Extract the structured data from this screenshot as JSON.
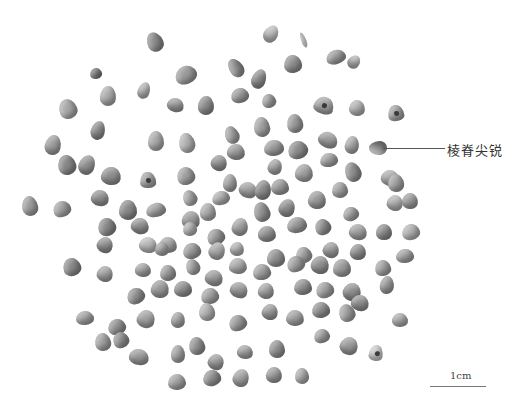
{
  "figure": {
    "annotation": {
      "label": "棱脊尖锐",
      "target": "seed-pointed-ridge"
    },
    "scale_bar": {
      "label": "1cm"
    }
  },
  "seeds": [
    [
      155,
      42,
      16,
      20,
      0,
      "#8a8a8a",
      0
    ],
    [
      271,
      34,
      14,
      18,
      20,
      "#b8b8b8",
      0
    ],
    [
      303,
      40,
      5,
      16,
      -20,
      "#e0e0e0",
      0
    ],
    [
      96,
      73,
      12,
      11,
      0,
      "#7a7a7a",
      0
    ],
    [
      108,
      96,
      16,
      20,
      -20,
      "#aaaaaa",
      0
    ],
    [
      144,
      90,
      12,
      17,
      10,
      "#b0b0b0",
      0
    ],
    [
      186,
      75,
      22,
      18,
      -20,
      "#999999",
      0
    ],
    [
      236,
      68,
      14,
      20,
      -20,
      "#909090",
      0
    ],
    [
      259,
      79,
      14,
      20,
      0,
      "#8a8a8a",
      0
    ],
    [
      240,
      95,
      18,
      15,
      -20,
      "#999999",
      0
    ],
    [
      293,
      64,
      18,
      18,
      0,
      "#8e8e8e",
      0
    ],
    [
      336,
      57,
      20,
      14,
      0,
      "#9a9a9a",
      0
    ],
    [
      354,
      62,
      12,
      14,
      20,
      "#b0b0b0",
      0
    ],
    [
      175,
      105,
      17,
      14,
      10,
      "#999999",
      0
    ],
    [
      206,
      105,
      16,
      19,
      10,
      "#8a8a8a",
      0
    ],
    [
      269,
      101,
      14,
      14,
      0,
      "#a0a0a0",
      0
    ],
    [
      324,
      105,
      20,
      17,
      0,
      "#a0a0a0",
      1
    ],
    [
      357,
      108,
      16,
      16,
      0,
      "#b0b0b0",
      0
    ],
    [
      396,
      113,
      16,
      16,
      0,
      "#a0a0a0",
      1
    ],
    [
      68,
      109,
      18,
      20,
      0,
      "#a6a6a6",
      0
    ],
    [
      98,
      130,
      14,
      19,
      0,
      "#8a8a8a",
      0
    ],
    [
      262,
      127,
      16,
      20,
      -10,
      "#a0a0a0",
      0
    ],
    [
      295,
      123,
      16,
      19,
      0,
      "#9a9a9a",
      0
    ],
    [
      232,
      135,
      14,
      18,
      0,
      "#a0a0a0",
      0
    ],
    [
      53,
      145,
      16,
      20,
      0,
      "#9c9c9c",
      0
    ],
    [
      156,
      141,
      16,
      20,
      0,
      "#a8a8a8",
      0
    ],
    [
      187,
      143,
      16,
      20,
      0,
      "#b0b0b0",
      0
    ],
    [
      328,
      140,
      20,
      16,
      0,
      "#9a9a9a",
      0
    ],
    [
      352,
      145,
      14,
      18,
      0,
      "#a6a6a6",
      0
    ],
    [
      378,
      148,
      14,
      18,
      -90,
      "#8e8e8e",
      0
    ],
    [
      67,
      165,
      18,
      20,
      0,
      "#888888",
      0
    ],
    [
      87,
      165,
      16,
      20,
      0,
      "#909090",
      0
    ],
    [
      111,
      176,
      20,
      18,
      0,
      "#8e8e8e",
      0
    ],
    [
      148,
      180,
      16,
      16,
      0,
      "#a0a0a0",
      1
    ],
    [
      186,
      176,
      18,
      18,
      0,
      "#a0a0a0",
      0
    ],
    [
      219,
      163,
      16,
      16,
      0,
      "#909090",
      0
    ],
    [
      236,
      152,
      18,
      16,
      0,
      "#999999",
      0
    ],
    [
      274,
      148,
      20,
      16,
      0,
      "#999999",
      0
    ],
    [
      298,
      150,
      20,
      18,
      0,
      "#8c8c8c",
      0
    ],
    [
      275,
      167,
      14,
      16,
      0,
      "#a0a0a0",
      0
    ],
    [
      304,
      173,
      18,
      18,
      0,
      "#a0a0a0",
      0
    ],
    [
      329,
      160,
      18,
      14,
      0,
      "#a0a0a0",
      0
    ],
    [
      353,
      172,
      16,
      20,
      0,
      "#8e8e8e",
      0
    ],
    [
      390,
      178,
      18,
      16,
      0,
      "#a8a8a8",
      0
    ],
    [
      230,
      183,
      14,
      18,
      0,
      "#a0a0a0",
      0
    ],
    [
      30,
      206,
      16,
      20,
      0,
      "#9c9c9c",
      0
    ],
    [
      62,
      209,
      18,
      16,
      0,
      "#a0a0a0",
      0
    ],
    [
      100,
      198,
      18,
      16,
      0,
      "#909090",
      0
    ],
    [
      128,
      210,
      18,
      20,
      0,
      "#888888",
      0
    ],
    [
      156,
      210,
      20,
      14,
      0,
      "#a0a0a0",
      0
    ],
    [
      190,
      198,
      14,
      16,
      0,
      "#a6a6a6",
      0
    ],
    [
      191,
      220,
      18,
      18,
      0,
      "#999999",
      0
    ],
    [
      208,
      212,
      16,
      18,
      0,
      "#a8a8a8",
      0
    ],
    [
      221,
      198,
      18,
      14,
      0,
      "#aaaaaa",
      0
    ],
    [
      248,
      190,
      18,
      16,
      0,
      "#a0a0a0",
      0
    ],
    [
      263,
      190,
      16,
      20,
      0,
      "#8a8a8a",
      0
    ],
    [
      280,
      187,
      18,
      16,
      0,
      "#999999",
      0
    ],
    [
      262,
      212,
      16,
      20,
      0,
      "#909090",
      0
    ],
    [
      287,
      208,
      16,
      18,
      0,
      "#8e8e8e",
      0
    ],
    [
      317,
      200,
      18,
      18,
      0,
      "#999999",
      0
    ],
    [
      340,
      190,
      16,
      16,
      0,
      "#a0a0a0",
      0
    ],
    [
      351,
      214,
      16,
      14,
      0,
      "#a0a0a0",
      0
    ],
    [
      395,
      203,
      16,
      16,
      0,
      "#b0b0b0",
      0
    ],
    [
      410,
      201,
      16,
      16,
      0,
      "#999999",
      0
    ],
    [
      396,
      183,
      16,
      18,
      0,
      "#a0a0a0",
      0
    ],
    [
      107,
      227,
      18,
      18,
      0,
      "#888888",
      0
    ],
    [
      140,
      226,
      18,
      16,
      0,
      "#909090",
      0
    ],
    [
      168,
      245,
      18,
      16,
      0,
      "#a0a0a0",
      0
    ],
    [
      190,
      229,
      14,
      14,
      0,
      "#b0b0b0",
      0
    ],
    [
      216,
      237,
      18,
      16,
      0,
      "#999999",
      0
    ],
    [
      240,
      227,
      16,
      18,
      0,
      "#a0a0a0",
      0
    ],
    [
      267,
      234,
      18,
      16,
      0,
      "#909090",
      0
    ],
    [
      297,
      225,
      20,
      16,
      0,
      "#999999",
      0
    ],
    [
      323,
      227,
      16,
      16,
      0,
      "#8e8e8e",
      0
    ],
    [
      358,
      232,
      18,
      16,
      0,
      "#a0a0a0",
      0
    ],
    [
      384,
      232,
      16,
      16,
      0,
      "#8a8a8a",
      0
    ],
    [
      411,
      232,
      18,
      16,
      0,
      "#b0b0b0",
      0
    ],
    [
      105,
      245,
      16,
      16,
      0,
      "#909090",
      0
    ],
    [
      148,
      245,
      18,
      16,
      0,
      "#b8b8b8",
      0
    ],
    [
      162,
      249,
      14,
      14,
      0,
      "#a0a0a0",
      0
    ],
    [
      192,
      251,
      18,
      16,
      0,
      "#999999",
      0
    ],
    [
      217,
      251,
      16,
      18,
      0,
      "#a8a8a8",
      0
    ],
    [
      237,
      249,
      14,
      14,
      0,
      "#b0b0b0",
      0
    ],
    [
      276,
      258,
      18,
      18,
      0,
      "#909090",
      0
    ],
    [
      304,
      255,
      16,
      16,
      0,
      "#a0a0a0",
      0
    ],
    [
      331,
      250,
      16,
      16,
      0,
      "#999999",
      0
    ],
    [
      358,
      252,
      16,
      16,
      0,
      "#8e8e8e",
      0
    ],
    [
      405,
      256,
      18,
      14,
      0,
      "#a0a0a0",
      0
    ],
    [
      72,
      267,
      18,
      18,
      0,
      "#888888",
      0
    ],
    [
      105,
      274,
      16,
      16,
      0,
      "#a0a0a0",
      0
    ],
    [
      143,
      270,
      16,
      14,
      0,
      "#a0a0a0",
      0
    ],
    [
      168,
      273,
      16,
      16,
      0,
      "#999999",
      0
    ],
    [
      193,
      267,
      14,
      16,
      0,
      "#a0a0a0",
      0
    ],
    [
      214,
      278,
      18,
      16,
      0,
      "#999999",
      0
    ],
    [
      238,
      266,
      18,
      16,
      0,
      "#a8a8a8",
      0
    ],
    [
      262,
      272,
      18,
      16,
      0,
      "#a0a0a0",
      0
    ],
    [
      296,
      264,
      18,
      16,
      0,
      "#a0a0a0",
      0
    ],
    [
      320,
      265,
      18,
      18,
      0,
      "#909090",
      0
    ],
    [
      342,
      268,
      18,
      18,
      0,
      "#999999",
      0
    ],
    [
      383,
      268,
      16,
      16,
      0,
      "#a0a0a0",
      0
    ],
    [
      136,
      296,
      18,
      16,
      0,
      "#909090",
      0
    ],
    [
      160,
      289,
      18,
      18,
      0,
      "#999999",
      0
    ],
    [
      183,
      289,
      18,
      16,
      0,
      "#8e8e8e",
      0
    ],
    [
      210,
      296,
      18,
      16,
      0,
      "#a0a0a0",
      0
    ],
    [
      239,
      290,
      18,
      16,
      0,
      "#999999",
      0
    ],
    [
      266,
      291,
      16,
      16,
      0,
      "#a0a0a0",
      0
    ],
    [
      303,
      287,
      18,
      16,
      0,
      "#909090",
      0
    ],
    [
      325,
      290,
      18,
      16,
      0,
      "#a0a0a0",
      0
    ],
    [
      352,
      292,
      18,
      18,
      0,
      "#8e8e8e",
      0
    ],
    [
      387,
      285,
      14,
      18,
      0,
      "#999999",
      0
    ],
    [
      85,
      318,
      18,
      14,
      0,
      "#a0a0a0",
      0
    ],
    [
      117,
      327,
      18,
      16,
      0,
      "#909090",
      0
    ],
    [
      146,
      319,
      18,
      18,
      0,
      "#a0a0a0",
      0
    ],
    [
      178,
      320,
      14,
      16,
      0,
      "#a0a0a0",
      0
    ],
    [
      207,
      312,
      16,
      18,
      0,
      "#b0b0b0",
      0
    ],
    [
      238,
      323,
      18,
      16,
      0,
      "#999999",
      0
    ],
    [
      270,
      312,
      16,
      16,
      0,
      "#999999",
      0
    ],
    [
      295,
      318,
      18,
      16,
      0,
      "#a0a0a0",
      0
    ],
    [
      321,
      310,
      18,
      16,
      0,
      "#8e8e8e",
      0
    ],
    [
      347,
      313,
      16,
      18,
      0,
      "#a0a0a0",
      0
    ],
    [
      360,
      303,
      18,
      16,
      0,
      "#909090",
      0
    ],
    [
      400,
      320,
      16,
      14,
      0,
      "#a8a8a8",
      0
    ],
    [
      103,
      342,
      16,
      18,
      0,
      "#a0a0a0",
      0
    ],
    [
      121,
      340,
      16,
      16,
      0,
      "#909090",
      0
    ],
    [
      139,
      357,
      20,
      16,
      0,
      "#999999",
      0
    ],
    [
      178,
      354,
      14,
      18,
      0,
      "#a0a0a0",
      0
    ],
    [
      197,
      346,
      16,
      18,
      0,
      "#909090",
      0
    ],
    [
      216,
      362,
      16,
      16,
      0,
      "#999999",
      0
    ],
    [
      245,
      352,
      16,
      14,
      0,
      "#a0a0a0",
      0
    ],
    [
      277,
      349,
      16,
      18,
      0,
      "#909090",
      0
    ],
    [
      322,
      336,
      16,
      14,
      0,
      "#a0a0a0",
      0
    ],
    [
      349,
      346,
      18,
      18,
      0,
      "#999999",
      0
    ],
    [
      376,
      353,
      14,
      16,
      0,
      "#c8c8c8",
      1
    ],
    [
      177,
      382,
      18,
      16,
      0,
      "#a0a0a0",
      0
    ],
    [
      212,
      378,
      18,
      16,
      0,
      "#909090",
      0
    ],
    [
      241,
      378,
      16,
      18,
      0,
      "#a0a0a0",
      0
    ],
    [
      274,
      375,
      16,
      16,
      0,
      "#999999",
      0
    ],
    [
      302,
      376,
      14,
      16,
      0,
      "#a8a8a8",
      0
    ]
  ]
}
